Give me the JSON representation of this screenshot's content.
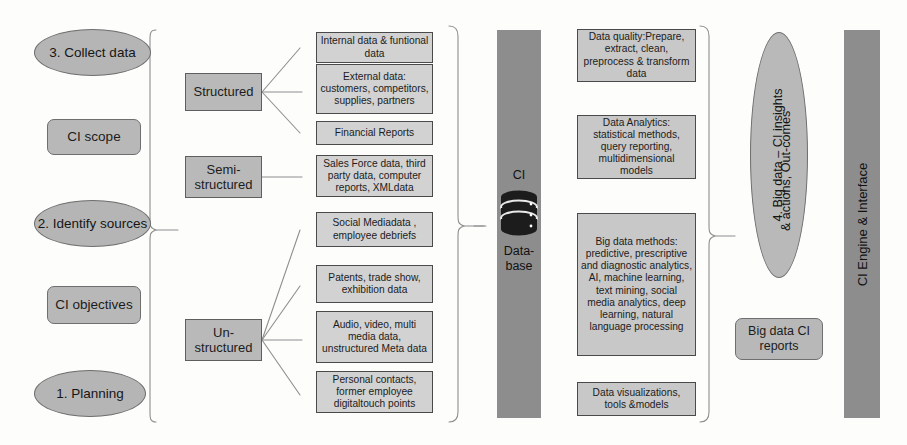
{
  "diagram": {
    "colors": {
      "ellipse_fill": "#b5b5b5",
      "pill_fill": "#b8b8b8",
      "graybox_fill": "#b9b9b9",
      "lightbox_fill": "#d2d2d2",
      "analbox_fill": "#c8c8c8",
      "bar_fill": "#8d8d8d",
      "stroke": "#5f5f5f",
      "text": "#141414",
      "background": "#fdfdfc"
    }
  },
  "stages": {
    "collect": "3. Collect data",
    "scope": "CI scope",
    "identify": "2. Identify sources",
    "objectives": "CI objectives",
    "planning": "1. Planning"
  },
  "data_types": [
    {
      "label": "Structured"
    },
    {
      "label": "Semi-structured"
    },
    {
      "label": "Un-structured"
    }
  ],
  "sources": [
    {
      "text": "Internal data & funtional data"
    },
    {
      "text": "External data: customers, competitors, supplies, partners"
    },
    {
      "text": "Financial Reports"
    },
    {
      "text": "Sales Force data, third party data, computer reports, XMLdata"
    },
    {
      "text": "Social Mediadata , employee debriefs"
    },
    {
      "text": "Patents, trade show, exhibition data"
    },
    {
      "text": "Audio, video, multi media data, unstructured Meta data"
    },
    {
      "text": "Personal contacts, former employee digitaltouch points"
    }
  ],
  "database": {
    "line1": "CI",
    "line2": "Data-",
    "line3": "base"
  },
  "analytics": [
    {
      "text": "Data quality:Prepare, extract, clean, preprocess & transform data"
    },
    {
      "text": "Data Analytics: statistical methods, query reporting, multidimensional models"
    },
    {
      "text": "Big data methods: predictive, prescriptive and diagnostic analytics, AI, machine learning, text mining, social media analytics, deep learning, natural language processing"
    },
    {
      "text": "Data visualizations, tools &models"
    }
  ],
  "outcome": {
    "ellipse_line1": "4. Big data – CI insights",
    "ellipse_line2": "& actions, Out-comes",
    "reports": "Big data CI reports"
  },
  "engine": {
    "label": "CI Engine & Interface"
  }
}
